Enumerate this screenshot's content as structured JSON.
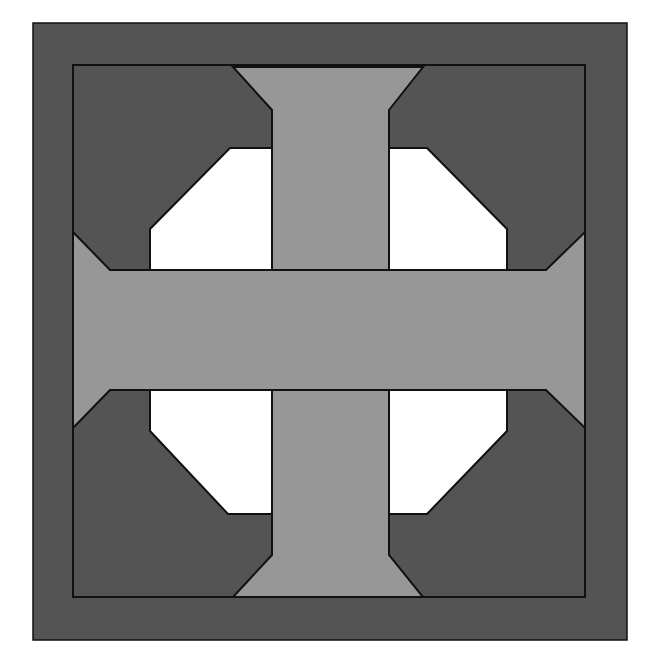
{
  "figure": {
    "colors": {
      "background": "#ffffff",
      "dark": "#545454",
      "medium": "#979797",
      "light": "#ffffff",
      "outline": "#111111"
    },
    "outer_border": {
      "x": 33,
      "y": 23,
      "w": 594,
      "h": 617
    },
    "inner_square": {
      "x": 73,
      "y": 65,
      "w": 512,
      "h": 532
    },
    "vertical_bar": "233,67 423,67 389,110 389,597 423,597 233,597 272,555 272,110",
    "horizontal_bar": "73,232 110,270 546,270 585,232 585,428 546,390 110,390 73,428",
    "vertical_bar_clean": "233,67 423,67 389,110 389,555 423,597 233,597 272,555 272,110",
    "windows": [
      {
        "name": "top-left",
        "points": "150,270 150,229 230,148 272,148 272,270"
      },
      {
        "name": "top-right",
        "points": "389,148 427,148 507,229 507,270 389,270"
      },
      {
        "name": "bottom-left",
        "points": "150,390 272,390 272,512 228,512 150,431"
      },
      {
        "name": "bottom-right",
        "points": "389,390 507,390 507,431 427,514 389,514"
      }
    ]
  }
}
